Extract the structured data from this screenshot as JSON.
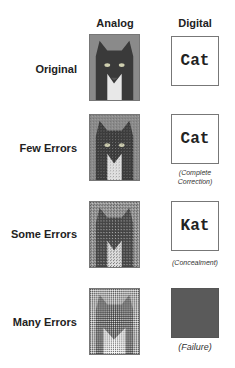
{
  "headers": {
    "analog": "Analog",
    "digital": "Digital"
  },
  "rows": [
    {
      "label": "Original",
      "digital_text": "Cat",
      "caption": "",
      "noise": 0
    },
    {
      "label": "Few Errors",
      "digital_text": "Cat",
      "caption_line1": "(Complete",
      "caption_line2": "Correction)",
      "noise": 1
    },
    {
      "label": "Some Errors",
      "digital_text": "Kat",
      "caption": "(Concealment)",
      "noise": 2
    },
    {
      "label": "Many Errors",
      "digital_text": "",
      "caption": "(Failure)",
      "noise": 3
    }
  ],
  "colors": {
    "failure_box": "#5a5a5a",
    "border": "#777777"
  }
}
